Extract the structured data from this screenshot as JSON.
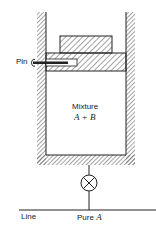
{
  "diagram": {
    "type": "piston-cylinder apparatus",
    "labels": {
      "pin": "Pin",
      "mixture_title": "Mixture",
      "mixture_formula": "A + B",
      "line": "Line",
      "pure_prefix": "Pure ",
      "pure_species": "A"
    },
    "components": [
      "cylinder-walls",
      "weight",
      "piston",
      "pin",
      "mixture-chamber",
      "valve",
      "supply-line"
    ],
    "colors": {
      "stroke": "#222222",
      "hatch": "#555555",
      "background": "#ffffff"
    }
  }
}
